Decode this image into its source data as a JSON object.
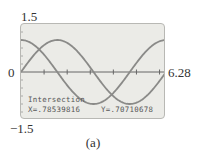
{
  "axes": {
    "ymax_label": "1.5",
    "ymin_label": "−1.5",
    "xmin_label": "0",
    "xmax_label": "6.28"
  },
  "readout": {
    "title": "Intersection",
    "x": "X=.78539816",
    "y": "Y=.70710678"
  },
  "caption": "(a)",
  "colors": {
    "screen_bg": "#ebebe7",
    "curve": "#8a8a88",
    "axis": "#666666"
  },
  "chart_data": {
    "type": "line",
    "title": "",
    "xlabel": "",
    "ylabel": "",
    "xlim": [
      0,
      6.28
    ],
    "ylim": [
      -1.5,
      1.5
    ],
    "grid": false,
    "x_ticks_every": 1,
    "series": [
      {
        "name": "y = sin x",
        "x": [
          0,
          0.785,
          1.571,
          3.142,
          4.712,
          6.28
        ],
        "values": [
          0,
          0.707,
          1,
          0,
          -1,
          0
        ]
      },
      {
        "name": "y = cos x",
        "x": [
          0,
          0.785,
          1.571,
          3.142,
          4.712,
          6.28
        ],
        "values": [
          1,
          0.707,
          0,
          -1,
          0,
          1
        ]
      }
    ],
    "annotations": [
      {
        "text": "Intersection",
        "x": 0.78539816,
        "y": 0.70710678
      }
    ]
  }
}
